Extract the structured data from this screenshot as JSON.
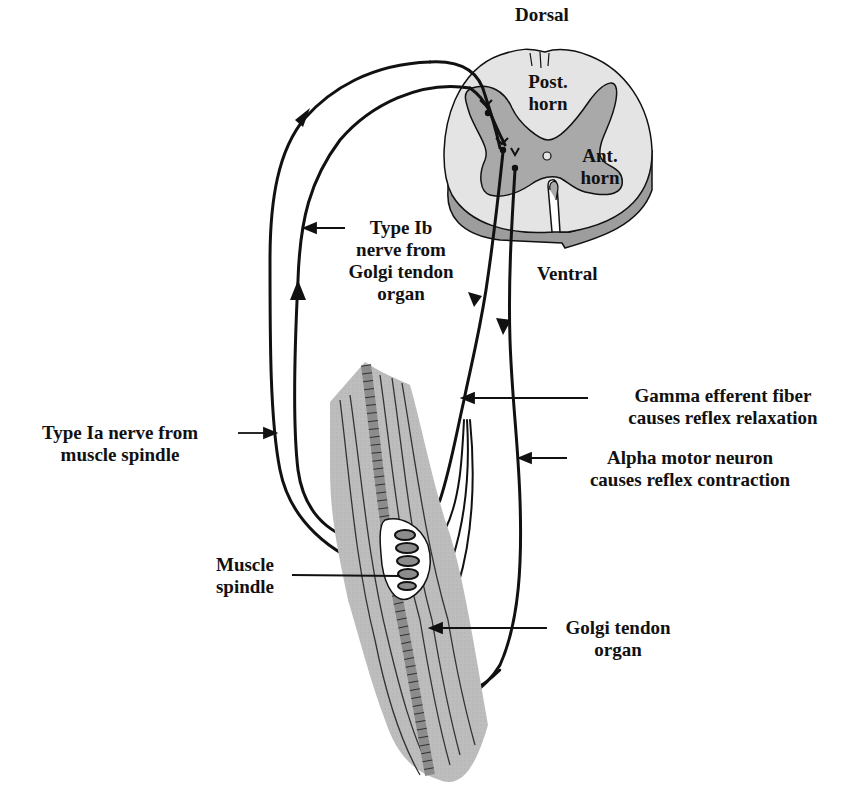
{
  "diagram": {
    "colors": {
      "ink": "#111111",
      "white_matter": "#e4e4e4",
      "gray_matter": "#a9a9a9",
      "ventral_shading": "#9d9d9d",
      "muscle": "#bdbdbd",
      "muscle_fiber_dark": "#8c8c8c",
      "background": "#ffffff"
    },
    "spinal_cord": {
      "dorsal": "Dorsal",
      "ventral": "Ventral",
      "posterior_horn": [
        "Post.",
        "horn"
      ],
      "anterior_horn": [
        "Ant.",
        "horn"
      ]
    },
    "labels": {
      "type_ib": [
        "Type Ib",
        "nerve from",
        "Golgi tendon",
        "organ"
      ],
      "type_ia": [
        "Type Ia nerve from",
        "muscle spindle"
      ],
      "gamma": [
        "Gamma efferent fiber",
        "causes reflex relaxation"
      ],
      "alpha": [
        "Alpha motor neuron",
        "causes reflex contraction"
      ],
      "muscle_spindle": [
        "Muscle",
        "spindle"
      ],
      "golgi_tendon_organ": [
        "Golgi tendon",
        "organ"
      ]
    }
  }
}
